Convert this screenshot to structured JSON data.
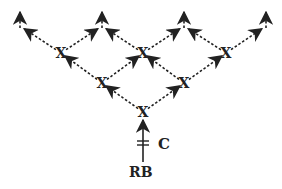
{
  "diagram": {
    "type": "branching-lineage-tree",
    "node_label": "X",
    "root_label": "RB",
    "stem_label": "C",
    "colors": {
      "line": "#222222",
      "background": "#ffffff"
    },
    "nodes": [
      {
        "id": "n0",
        "label": "X",
        "x": 143,
        "y": 112,
        "row": 3
      },
      {
        "id": "n1",
        "label": "X",
        "x": 102,
        "y": 83,
        "row": 2
      },
      {
        "id": "n2",
        "label": "X",
        "x": 184,
        "y": 83,
        "row": 2
      },
      {
        "id": "n3",
        "label": "X",
        "x": 61,
        "y": 53,
        "row": 1
      },
      {
        "id": "n4",
        "label": "X",
        "x": 143,
        "y": 53,
        "row": 1
      },
      {
        "id": "n5",
        "label": "X",
        "x": 226,
        "y": 53,
        "row": 1
      }
    ],
    "outputs": [
      {
        "x": 20,
        "y": 14
      },
      {
        "x": 102,
        "y": 14
      },
      {
        "x": 184,
        "y": 14
      },
      {
        "x": 266,
        "y": 14
      }
    ]
  }
}
